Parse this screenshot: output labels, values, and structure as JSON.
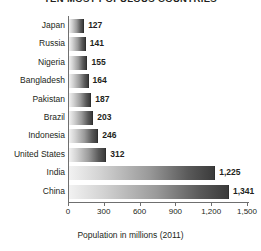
{
  "chart_data": {
    "type": "bar",
    "orientation": "horizontal",
    "title": "TEN MOST POPULOUS COUNTRIES",
    "xlabel": "Population in millions (2011)",
    "ylabel": "",
    "categories": [
      "Japan",
      "Russia",
      "Nigeria",
      "Bangladesh",
      "Pakistan",
      "Brazil",
      "Indonesia",
      "United States",
      "India",
      "China"
    ],
    "values": [
      127,
      141,
      155,
      164,
      187,
      203,
      246,
      312,
      1225,
      1341
    ],
    "value_labels": [
      "127",
      "141",
      "155",
      "164",
      "187",
      "203",
      "246",
      "312",
      "1,225",
      "1,341"
    ],
    "xlim": [
      0,
      1500
    ],
    "xticks": [
      0,
      300,
      600,
      900,
      1200,
      1500
    ],
    "xtick_labels": [
      "0",
      "300",
      "600",
      "900",
      "1,200",
      "1,500"
    ],
    "grid": false,
    "legend": null,
    "bar_fill": "gradient-light-to-dark-gray",
    "colors": {
      "bar_gradient_start": "#f2f2f2",
      "bar_gradient_end": "#3b3b3b",
      "axis": "#6f6f6f",
      "text": "#231f20",
      "background": "#ffffff"
    }
  }
}
